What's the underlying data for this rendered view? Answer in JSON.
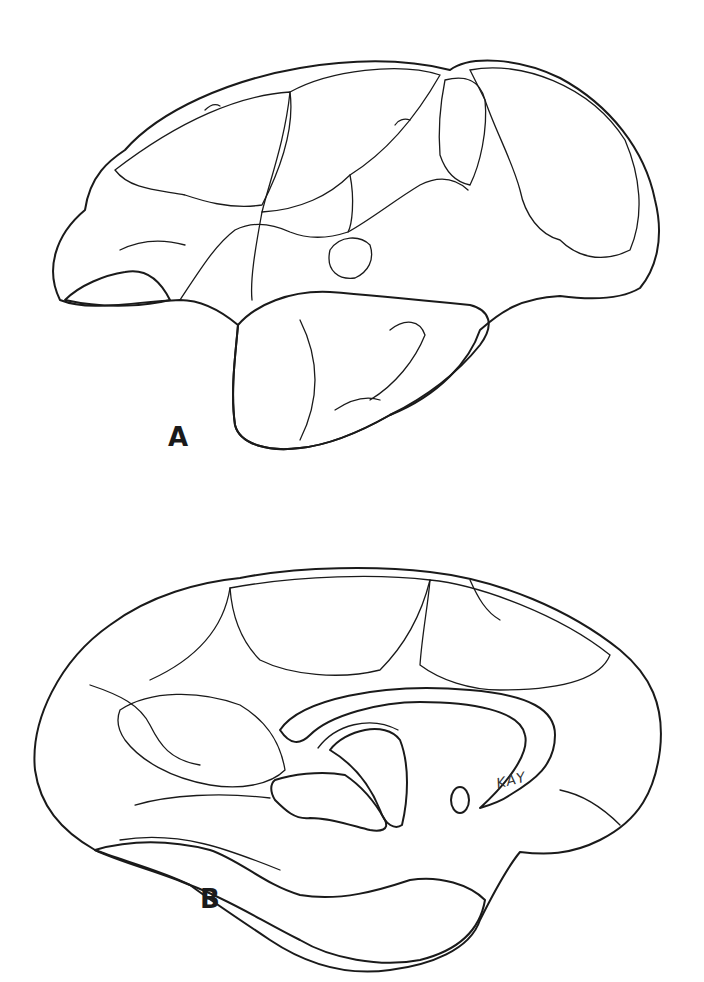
{
  "figure": {
    "type": "anatomical stipple illustration",
    "colors": {
      "ink": "#1a1a1a",
      "paper": "#ffffff"
    },
    "panels": [
      {
        "id": "A",
        "label": "A",
        "view": "lateral surface of cerebral hemisphere"
      },
      {
        "id": "B",
        "label": "B",
        "view": "medial surface of cerebral hemisphere"
      }
    ],
    "signature": "KAY"
  }
}
